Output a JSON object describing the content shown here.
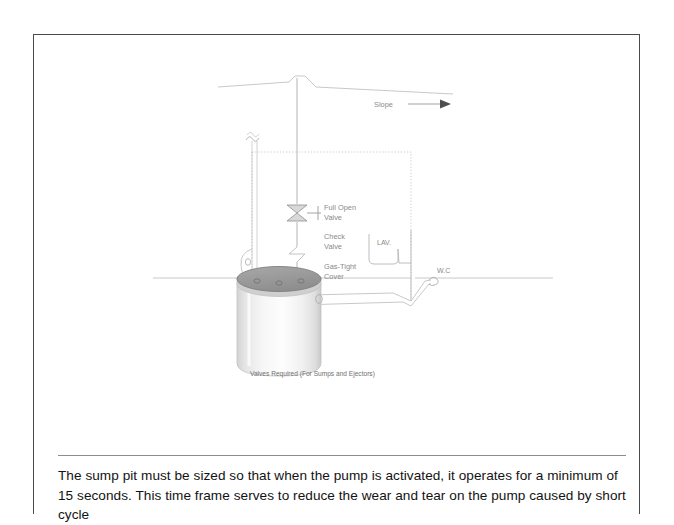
{
  "document": {
    "page_background": "#ffffff",
    "border_color": "#4a4a4a"
  },
  "figure": {
    "caption": "Valves Required (For Sumps and Ejectors)",
    "labels": {
      "slope": "Slope",
      "full_open_valve_line1": "Full Open",
      "full_open_valve_line2": "Valve",
      "check_valve_line1": "Check",
      "check_valve_line2": "Valve",
      "gas_tight_cover_line1": "Gas-Tight",
      "gas_tight_cover_line2": "Cover",
      "lavatory": "LAV.",
      "water_closet": "W.C"
    },
    "colors": {
      "line": "#b9b9b9",
      "line_dark": "#9a9a9a",
      "label_text": "#8a8a8a",
      "caption_text": "#707070",
      "cover_fill": "#9d9d9d",
      "cover_stroke": "#7a7a7a",
      "sump_light": "#f2f2f2",
      "sump_mid": "#fbfbfb",
      "sump_edge": "#cfcfcf"
    }
  },
  "body": {
    "paragraph": "The sump pit must be sized so that when the pump is activated, it operates for a minimum of 15 seconds. This time frame serves to reduce the wear and tear on the pump caused by short cycle"
  }
}
